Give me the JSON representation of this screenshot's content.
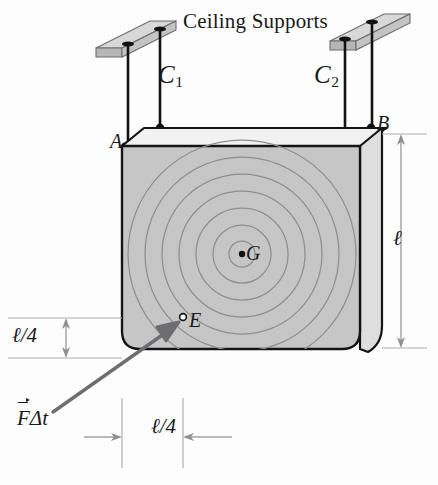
{
  "figure": {
    "title": "Ceiling Supports",
    "type": "physics-free-body-diagram",
    "caption_labels": {
      "ceiling_supports": "Ceiling Supports",
      "cable_left": "C",
      "cable_left_sub": "1",
      "cable_right": "C",
      "cable_right_sub": "2",
      "point_a": "A",
      "point_b": "B",
      "point_g": "G",
      "point_e": "E",
      "dimension_height": "ℓ",
      "dimension_vertical_quarter": "ℓ/4",
      "dimension_horizontal_quarter": "ℓ/4",
      "impulse_vector_F": "F",
      "impulse_vector_rest": "Δt"
    }
  },
  "colors": {
    "block_front": "#c6c6c6",
    "block_side": "#dcdcdc",
    "block_top": "#f0f0f0",
    "support_slab_top": "#d2d2d2",
    "support_slab_side": "#b4b4b4",
    "outline": "#141414",
    "circle_stroke": "#8a8a8a",
    "impulse_arrow": "#6e6e72",
    "dimension_line": "#a8a8a8",
    "background": "#fdfdfd"
  },
  "geometry": {
    "block_front_face": {
      "x": 122,
      "y": 144,
      "width": 238,
      "height": 205
    },
    "block_depth_offset": {
      "dx": 22,
      "dy": -20
    },
    "center_of_mass_G": {
      "x": 242,
      "y": 254
    },
    "impact_point_E": {
      "x": 182,
      "y": 318
    },
    "impulse_arrow_tail": {
      "x": 53,
      "y": 412
    },
    "impulse_arrow_head": {
      "x": 178,
      "y": 322
    },
    "concentric_circle_radii": [
      12,
      28,
      45,
      62,
      79,
      96,
      113
    ],
    "attachment_point_A": {
      "x": 124,
      "y": 146
    },
    "attachment_point_B": {
      "x": 364,
      "y": 130
    },
    "cable_left_x": [
      128,
      160
    ],
    "cable_right_x": [
      345,
      372
    ],
    "support_left_slab": {
      "x": 96,
      "y": 22
    },
    "support_right_slab": {
      "x": 330,
      "y": 14
    }
  },
  "dimension_values": {
    "block_height": "ℓ",
    "E_height_from_bottom": "ℓ/4",
    "E_offset_from_left": "ℓ/4"
  }
}
